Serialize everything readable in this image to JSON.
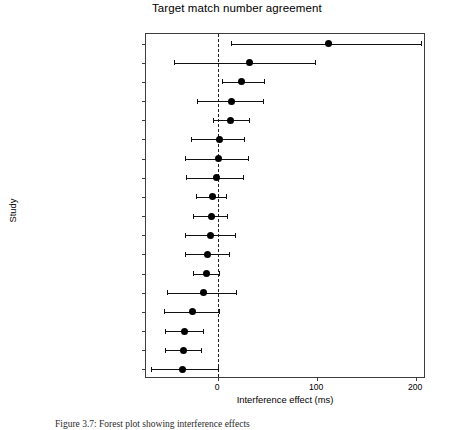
{
  "figure": {
    "title": "Target match\nnumber agreement",
    "caption": "Figure 3.7: Forest plot showing interference effects"
  },
  "chart_data": {
    "type": "scatter",
    "title": "Target match number agreement",
    "xlabel": "Interference effect (ms)",
    "ylabel": "Study",
    "xlim": [
      -73,
      210
    ],
    "xticks": [
      0,
      100,
      200
    ],
    "xticklabels": [
      "0",
      "100",
      "200"
    ],
    "grid": false,
    "reference_line": 0,
    "legend": "none",
    "categories": [
      "FranckEtAl15E1RC",
      "FranckEtAl15E1Compl",
      "PearlmutterEtAl99E3plu",
      "WagersEtAl09E3plu",
      "LagoEtAl15E3b",
      "WagersEtAl09E6",
      "WagersEtAl09E3sing",
      "LagoEtAl15E1",
      "TuckerEtAl2015",
      "LagoEtAl15E2",
      "WagersEtAl09E2",
      "WagersEtAl09E5",
      "LagoEtAl15E3a",
      "DillonEtAl13E1agrmt",
      "WagersEtAl09E4",
      "PearlmutterEtAl99E1",
      "PearlmutterEtAl99E3sing",
      "PearlmutterEtAl99E2"
    ],
    "estimates": [
      111,
      32,
      24,
      13,
      12,
      1,
      0,
      -2,
      -6,
      -7,
      -8,
      -11,
      -12,
      -15,
      -26,
      -34,
      -35,
      -36
    ],
    "ci_lower": [
      13,
      -45,
      4,
      -21,
      -5,
      -28,
      -34,
      -33,
      -22,
      -25,
      -34,
      -34,
      -25,
      -52,
      -55,
      -54,
      -54,
      -68
    ],
    "ci_upper": [
      205,
      98,
      46,
      45,
      31,
      26,
      30,
      25,
      8,
      9,
      17,
      11,
      1,
      18,
      1,
      -15,
      -17,
      0
    ],
    "point_color": "#000000",
    "line_color": "#111111",
    "reference_line_color": "#222222"
  }
}
